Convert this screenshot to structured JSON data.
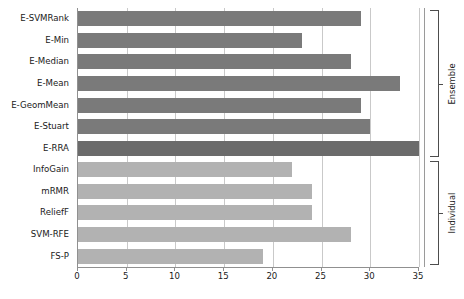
{
  "chart_data": {
    "type": "bar",
    "orientation": "horizontal",
    "title": "",
    "xlabel": "",
    "ylabel": "",
    "xlim": [
      0,
      35
    ],
    "xticks": [
      0,
      5,
      10,
      15,
      20,
      25,
      30,
      35
    ],
    "xtick_labels": [
      "0",
      "5",
      "10",
      "15",
      "20",
      "25",
      "30",
      "35"
    ],
    "grid": true,
    "grid_axis": "x",
    "legend": "none",
    "categories": [
      "E-SVMRank",
      "E-Min",
      "E-Median",
      "E-Mean",
      "E-GeomMean",
      "E-Stuart",
      "E-RRA",
      "InfoGain",
      "mRMR",
      "ReliefF",
      "SVM-RFE",
      "FS-P"
    ],
    "values": [
      29,
      23,
      28,
      33,
      29,
      30,
      35,
      22,
      24,
      24,
      28,
      19
    ],
    "bar_colors": [
      "#7a7a7a",
      "#7a7a7a",
      "#7a7a7a",
      "#7a7a7a",
      "#7a7a7a",
      "#7a7a7a",
      "#6b6b6b",
      "#b2b2b2",
      "#b2b2b2",
      "#b2b2b2",
      "#b2b2b2",
      "#b2b2b2"
    ],
    "groups": [
      {
        "label": "Ensemble",
        "first_index": 0,
        "last_index": 6,
        "color": "#7a7a7a"
      },
      {
        "label": "Individual",
        "first_index": 7,
        "last_index": 11,
        "color": "#b2b2b2"
      }
    ],
    "annotations": [
      {
        "name": "ensemble-bracket",
        "label": "Ensemble"
      },
      {
        "name": "individual-bracket",
        "label": "Individual"
      }
    ]
  },
  "colors": {
    "ensemble_bar": "#7a7a7a",
    "erra_bar": "#6b6b6b",
    "individual_bar": "#b2b2b2",
    "gridline": "#c9c9c9",
    "axis": "#909090",
    "text": "#1a1a1a",
    "background": "#ffffff"
  }
}
